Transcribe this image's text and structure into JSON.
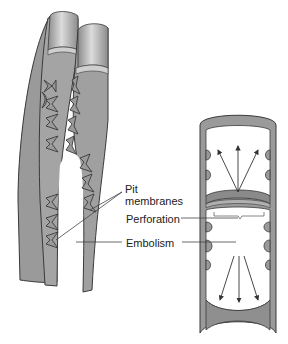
{
  "diagram": {
    "labels": {
      "pit_membranes_line1": "Pit",
      "pit_membranes_line2": "membranes",
      "perforation": "Perforation",
      "embolism": "Embolism"
    },
    "components": [
      {
        "id": "tracheids",
        "description": "Two overlapping tracheids joined by pit pairs, left"
      },
      {
        "id": "vessel-element",
        "description": "Vessel element segment with perforation plate and arrows showing tension, right"
      }
    ],
    "colors": {
      "wall_fill": "#9a9a9a",
      "wall_stroke": "#3a3a3a",
      "top_highlight": "#d6d6d6",
      "lumen_fill": "#ffffff",
      "leader_line": "#444444",
      "arrow": "#333333"
    }
  }
}
